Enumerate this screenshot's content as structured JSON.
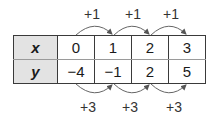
{
  "table": {
    "rows": [
      {
        "header": "x",
        "values": [
          "0",
          "1",
          "2",
          "3"
        ]
      },
      {
        "header": "y",
        "values": [
          "−4",
          "−1",
          "2",
          "5"
        ]
      }
    ]
  },
  "top_labels": [
    "+1",
    "+1",
    "+1"
  ],
  "bottom_labels": [
    "+3",
    "+3",
    "+3"
  ],
  "colors": {
    "header_bg": "#e3e3e3",
    "border": "#3a3a3a",
    "arrow": "#555555"
  }
}
